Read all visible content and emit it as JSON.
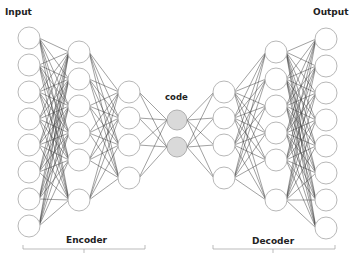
{
  "diagram": {
    "labels": {
      "input": "Input",
      "output": "Output",
      "code": "code",
      "encoder": "Encoder",
      "decoder": "Decoder"
    },
    "colors": {
      "node_stroke": "#b8b8b8",
      "node_fill": "#ffffff",
      "code_fill": "#d9d9d9",
      "code_stroke": "#b0b0b0",
      "edge": "#333333",
      "bracket": "#aaaaaa"
    },
    "node_radius": 11,
    "layers": [
      {
        "name": "input",
        "x": 29,
        "ys": [
          38,
          65,
          92,
          119,
          145,
          172,
          199,
          226
        ]
      },
      {
        "name": "encoder-hidden-1",
        "x": 79,
        "ys": [
          52,
          79,
          106,
          133,
          160,
          200
        ]
      },
      {
        "name": "encoder-hidden-2",
        "x": 129,
        "ys": [
          92,
          118,
          145,
          178
        ]
      },
      {
        "name": "code",
        "x": 177,
        "ys": [
          120,
          147
        ],
        "highlight": true
      },
      {
        "name": "decoder-hidden-1",
        "x": 224,
        "ys": [
          92,
          118,
          145,
          178
        ]
      },
      {
        "name": "decoder-hidden-2",
        "x": 276,
        "ys": [
          52,
          79,
          106,
          133,
          160,
          200
        ]
      },
      {
        "name": "output",
        "x": 326,
        "ys": [
          39,
          66,
          93,
          120,
          146,
          173,
          200,
          228
        ]
      }
    ],
    "brackets": [
      {
        "name": "encoder",
        "x1": 23,
        "x2": 145,
        "y": 249,
        "tick_x": 84
      },
      {
        "name": "decoder",
        "x1": 213,
        "x2": 335,
        "y": 249,
        "tick_x": 273
      }
    ]
  }
}
